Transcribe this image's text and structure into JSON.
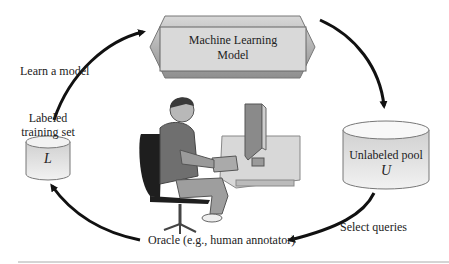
{
  "model_box": {
    "line1": "Machine Learning",
    "line2": "Model"
  },
  "labeled_set": {
    "caption_line1": "Labeled",
    "caption_line2": "training set",
    "symbol": "L"
  },
  "unlabeled_pool": {
    "caption": "Unlabeled pool",
    "symbol": "U"
  },
  "edges": {
    "learn": "Learn a model",
    "select": "Select queries",
    "oracle": "Oracle (e.g., human annotator)"
  },
  "colors": {
    "arrow": "#111111",
    "shape_fill_light": "#e6e6e6",
    "shape_fill_dark": "#a8a8a8"
  }
}
